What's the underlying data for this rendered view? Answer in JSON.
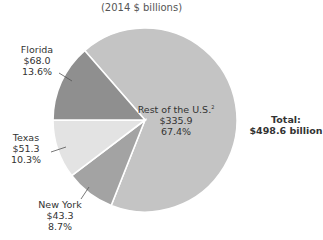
{
  "chart_data": {
    "type": "pie",
    "title": "",
    "subtitle": "(2014 $ billions)",
    "unit": "$ billions",
    "slices": [
      {
        "label": "Rest of the U.S.",
        "footnote": "2",
        "value": 335.9,
        "value_label": "$335.9",
        "percent": 67.4,
        "percent_label": "67.4%",
        "color": "#c4c4c4"
      },
      {
        "label": "New York",
        "value": 43.3,
        "value_label": "$43.3",
        "percent": 8.7,
        "percent_label": "8.7%",
        "color": "#a3a3a3"
      },
      {
        "label": "Texas",
        "value": 51.3,
        "value_label": "$51.3",
        "percent": 10.3,
        "percent_label": "10.3%",
        "color": "#e3e3e3"
      },
      {
        "label": "Florida",
        "value": 68.0,
        "value_label": "$68.0",
        "percent": 13.6,
        "percent_label": "13.6%",
        "color": "#8f8f8f"
      }
    ],
    "total": {
      "label": "Total:",
      "value": 498.6,
      "value_label": "$498.6 billion"
    }
  }
}
